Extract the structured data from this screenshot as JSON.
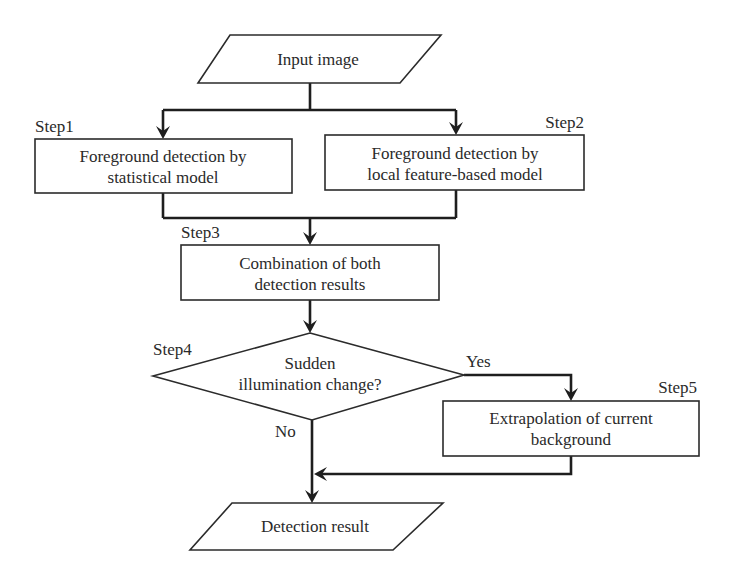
{
  "diagram": {
    "type": "flowchart",
    "colors": {
      "stroke": "#2b2b2b",
      "edge": "#1e1e1e",
      "text": "#2a2a2a",
      "background": "#ffffff"
    },
    "nodes": {
      "input": {
        "shape": "parallelogram",
        "label": "Input image"
      },
      "step1": {
        "shape": "rectangle",
        "step": "Step1",
        "lines": [
          "Foreground detection by",
          "statistical model"
        ]
      },
      "step2": {
        "shape": "rectangle",
        "step": "Step2",
        "lines": [
          "Foreground detection by",
          "local feature-based model"
        ]
      },
      "step3": {
        "shape": "rectangle",
        "step": "Step3",
        "lines": [
          "Combination of both",
          "detection results"
        ]
      },
      "step4": {
        "shape": "diamond",
        "step": "Step4",
        "lines": [
          "Sudden",
          "illumination change?"
        ]
      },
      "step5": {
        "shape": "rectangle",
        "step": "Step5",
        "lines": [
          "Extrapolation of current",
          "background"
        ]
      },
      "output": {
        "shape": "parallelogram",
        "label": "Detection result"
      }
    },
    "branches": {
      "yes": "Yes",
      "no": "No"
    },
    "edges": [
      {
        "from": "input",
        "to": "step1"
      },
      {
        "from": "input",
        "to": "step2"
      },
      {
        "from": "step1",
        "to": "step3"
      },
      {
        "from": "step2",
        "to": "step3"
      },
      {
        "from": "step3",
        "to": "step4"
      },
      {
        "from": "step4",
        "to": "step5",
        "label": "Yes"
      },
      {
        "from": "step4",
        "to": "output",
        "label": "No"
      },
      {
        "from": "step5",
        "to": "output"
      }
    ]
  }
}
